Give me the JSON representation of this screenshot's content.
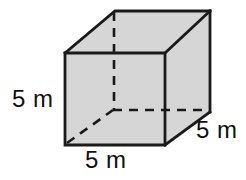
{
  "figure": {
    "name": "cube-diagram",
    "shape": "cube",
    "colors": {
      "face_fill": "#d6d6d6",
      "edge_stroke": "#1a1a1a",
      "hidden_edge_stroke": "#1a1a1a",
      "background": "#ffffff",
      "label_text": "#111111"
    },
    "labels": {
      "height": "5 m",
      "width": "5 m",
      "depth": "5 m"
    },
    "geometry": {
      "front_face": "65,53 165,53 165,145 65,145",
      "top_face": "65,53 115,11 210,11 165,53",
      "right_face": "165,53 210,11 210,112 165,145",
      "hidden_vertical": "114,11 114,110",
      "hidden_horizontal": "114,110 208,110",
      "hidden_diagonal": "66,144 113,110"
    }
  }
}
